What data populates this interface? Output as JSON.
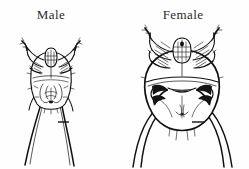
{
  "plate": {
    "title_male": "Male",
    "title_female": "Female",
    "background_color": "#fefefe",
    "ink_color": "#101010",
    "subject": "mite-line-drawing-comparison-plate",
    "figures": [
      {
        "id": "male",
        "label": "Male",
        "view": "ventral",
        "relative_size": "smaller",
        "body_shape": "elongate-oval",
        "has_scale_bar": true,
        "leg_pairs": 4,
        "trailing_legs": "long-straight-diverging"
      },
      {
        "id": "female",
        "label": "Female",
        "view": "ventral",
        "relative_size": "larger",
        "body_shape": "broad-rounded",
        "has_scale_bar": true,
        "leg_pairs": 4,
        "trailing_legs": "long-curved-sweeping"
      }
    ]
  }
}
